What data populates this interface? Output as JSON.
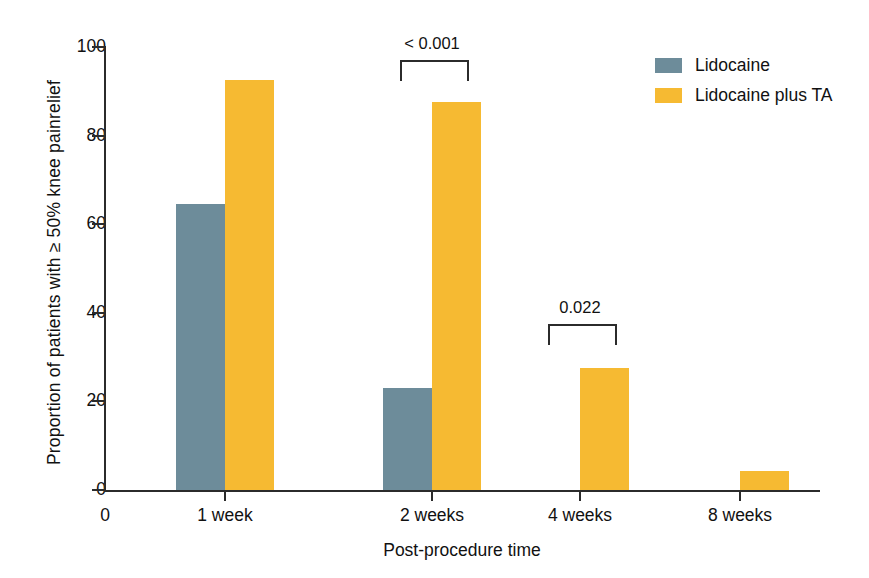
{
  "chart_data": {
    "type": "bar",
    "title": "",
    "xlabel": "Post-procedure time",
    "ylabel": "Proportion of patients with  ≥ 50% knee painrelief",
    "categories": [
      "1 week",
      "2 weeks",
      "4 weeks",
      "8 weeks"
    ],
    "origin_label": "0",
    "ylim": [
      0,
      100
    ],
    "yticks": [
      0,
      20,
      40,
      60,
      80,
      100
    ],
    "ytick_labels": [
      "0",
      "20",
      "40",
      "60",
      "80",
      "100"
    ],
    "grid": false,
    "legend_position": "top-right",
    "series": [
      {
        "name": "Lidocaine",
        "color": "#6d8c9a",
        "values": [
          64.5,
          23.0,
          0,
          0
        ]
      },
      {
        "name": "Lidocaine plus TA",
        "color": "#f6ba32",
        "values": [
          92.5,
          87.5,
          27.5,
          4.3
        ]
      }
    ],
    "annotations": [
      {
        "text": "< 0.001",
        "category": "2 weeks",
        "y": 97.0
      },
      {
        "text": "0.022",
        "category": "4 weeks",
        "y": 37.5
      }
    ]
  },
  "legend": {
    "items": [
      {
        "label": "Lidocaine",
        "color": "#6d8c9a"
      },
      {
        "label": "Lidocaine plus TA",
        "color": "#f6ba32"
      }
    ]
  },
  "axes": {
    "y_title": "Proportion of patients with  ≥ 50% knee painrelief",
    "x_title": "Post-procedure time"
  }
}
